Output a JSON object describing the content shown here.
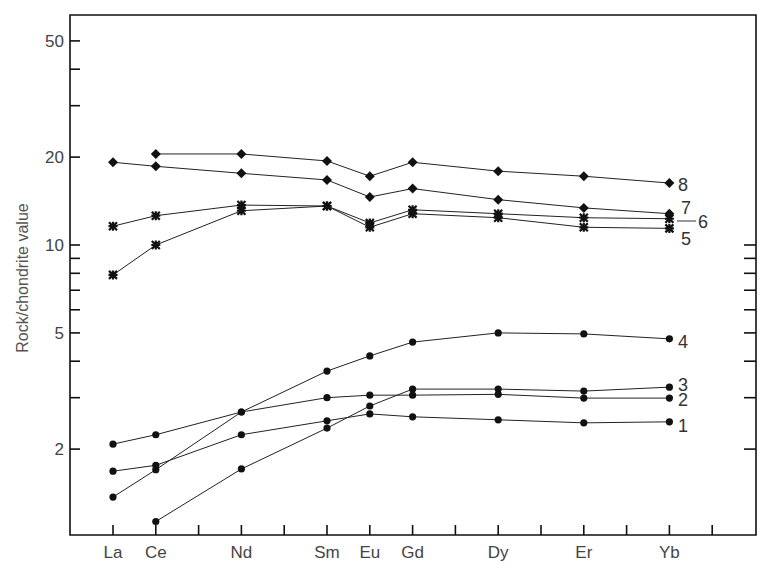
{
  "chart_data": {
    "type": "line",
    "title": "",
    "xlabel": "",
    "ylabel": "Rock/chondrite value",
    "yscale": "log",
    "ylim": [
      1.1,
      60
    ],
    "grid": false,
    "legend_position": "inline-right",
    "x_ticks": [
      "La",
      "Ce",
      "Pr",
      "Nd",
      "Pm",
      "Sm",
      "Eu",
      "Gd",
      "Tb",
      "Dy",
      "Ho",
      "Er",
      "Tm",
      "Yb",
      "Lu"
    ],
    "categories": [
      "La",
      "Ce",
      "Nd",
      "Sm",
      "Eu",
      "Gd",
      "Dy",
      "Er",
      "Yb"
    ],
    "y_tick_labels": [
      "50",
      "20",
      "10",
      "5",
      "2"
    ],
    "y_minor_ticks": [
      40,
      30,
      9,
      8,
      7,
      6,
      4,
      3
    ],
    "series": [
      {
        "name": "1",
        "marker": "circle",
        "values": [
          1.68,
          1.76,
          2.24,
          2.5,
          2.64,
          2.58,
          2.52,
          2.46,
          2.48
        ]
      },
      {
        "name": "2",
        "marker": "circle",
        "values": [
          2.08,
          2.24,
          2.68,
          3.0,
          3.06,
          3.06,
          3.08,
          2.99,
          2.99
        ]
      },
      {
        "name": "3",
        "marker": "circle",
        "values": [
          null,
          1.13,
          1.71,
          2.36,
          2.81,
          3.21,
          3.21,
          3.16,
          3.26
        ]
      },
      {
        "name": "4",
        "marker": "circle",
        "values": [
          1.37,
          1.7,
          2.68,
          3.7,
          4.17,
          4.65,
          5.0,
          4.96,
          4.77
        ]
      },
      {
        "name": "5",
        "marker": "asterisk",
        "values": [
          7.9,
          10.0,
          13.1,
          13.6,
          11.5,
          12.8,
          12.4,
          11.5,
          11.4
        ]
      },
      {
        "name": "6",
        "marker": "asterisk",
        "values": [
          11.6,
          12.6,
          13.7,
          13.6,
          11.9,
          13.2,
          12.8,
          12.4,
          12.3
        ]
      },
      {
        "name": "7",
        "marker": "diamond",
        "values": [
          19.2,
          18.6,
          17.6,
          16.7,
          14.6,
          15.6,
          14.3,
          13.4,
          12.8
        ]
      },
      {
        "name": "8",
        "marker": "diamond",
        "values": [
          null,
          20.5,
          20.5,
          19.4,
          17.2,
          19.2,
          17.9,
          17.2,
          16.3
        ]
      }
    ],
    "annotations": [
      "8",
      "7",
      "6",
      "5",
      "4",
      "3",
      "2",
      "1"
    ]
  }
}
